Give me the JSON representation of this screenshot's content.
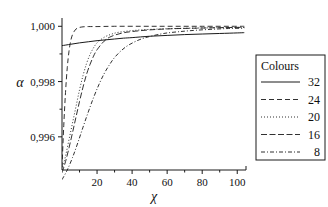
{
  "chart_data": {
    "type": "line",
    "title": "",
    "xlabel": "χ",
    "ylabel": "α",
    "xlim": [
      0,
      105
    ],
    "ylim": [
      0.9948,
      1.0003
    ],
    "grid": false,
    "legend_position": "right-outside",
    "legend_title": "Colours",
    "x_ticks": [
      20,
      40,
      60,
      80,
      100
    ],
    "x_tick_labels": [
      "20",
      "40",
      "60",
      "80",
      "100"
    ],
    "y_ticks": [
      0.996,
      0.998,
      1.0
    ],
    "y_tick_labels": [
      "0,996",
      "0,998",
      "1,000"
    ],
    "series": [
      {
        "name": "32",
        "label": "32",
        "style": "solid",
        "dash": "none",
        "color": "#1a1a1a",
        "x": [
          0,
          5,
          10,
          15,
          20,
          25,
          30,
          35,
          40,
          50,
          60,
          70,
          80,
          90,
          100,
          104
        ],
        "values": [
          0.9993,
          0.99935,
          0.9994,
          0.99944,
          0.99948,
          0.99951,
          0.99954,
          0.99957,
          0.99959,
          0.99964,
          0.99967,
          0.9997,
          0.99972,
          0.99974,
          0.99976,
          0.99977
        ]
      },
      {
        "name": "24",
        "label": "24",
        "style": "dashed",
        "dash": "5,3",
        "color": "#1a1a1a",
        "x": [
          0,
          1,
          2,
          3,
          4,
          5,
          6,
          7,
          8,
          9,
          10,
          12,
          15,
          20,
          30,
          45,
          60,
          80,
          100,
          104
        ],
        "values": [
          0.9949,
          0.9964,
          0.9976,
          0.9985,
          0.9991,
          0.99948,
          0.9997,
          0.99982,
          0.9999,
          0.99994,
          0.99996,
          0.99998,
          0.99999,
          0.99999,
          1.0,
          1.0,
          1.0,
          1.0,
          1.0,
          1.0
        ]
      },
      {
        "name": "20",
        "label": "20",
        "style": "dotted",
        "dash": "1,2",
        "color": "#1a1a1a",
        "x": [
          0,
          2,
          4,
          6,
          8,
          10,
          12,
          14,
          16,
          18,
          20,
          24,
          28,
          32,
          38,
          45,
          55,
          65,
          80,
          100,
          104
        ],
        "values": [
          0.9948,
          0.9953,
          0.9959,
          0.9965,
          0.9971,
          0.9977,
          0.99822,
          0.99865,
          0.99898,
          0.99922,
          0.9994,
          0.9996,
          0.99971,
          0.99978,
          0.99983,
          0.99987,
          0.9999,
          0.99992,
          0.99994,
          0.99996,
          0.99996
        ]
      },
      {
        "name": "16",
        "label": "16",
        "style": "long-dashed",
        "dash": "6,2.5",
        "color": "#1a1a1a",
        "x": [
          0,
          2,
          4,
          6,
          8,
          10,
          12,
          14,
          16,
          18,
          20,
          24,
          28,
          34,
          40,
          50,
          62,
          75,
          90,
          100,
          104
        ],
        "values": [
          0.9947,
          0.9951,
          0.9956,
          0.99615,
          0.99672,
          0.99728,
          0.9978,
          0.99826,
          0.99862,
          0.99892,
          0.99915,
          0.99946,
          0.99963,
          0.99975,
          0.99981,
          0.99987,
          0.99991,
          0.99993,
          0.99995,
          0.99996,
          0.99996
        ]
      },
      {
        "name": "8",
        "label": "8",
        "style": "dash-dot",
        "dash": "4,2,1,2",
        "color": "#1a1a1a",
        "x": [
          0,
          3,
          6,
          9,
          12,
          15,
          18,
          21,
          24,
          27,
          30,
          34,
          38,
          44,
          50,
          58,
          66,
          75,
          85,
          95,
          104
        ],
        "values": [
          0.99445,
          0.9948,
          0.99525,
          0.99578,
          0.99635,
          0.9969,
          0.99742,
          0.99788,
          0.99828,
          0.9986,
          0.99887,
          0.99913,
          0.99932,
          0.99951,
          0.99963,
          0.99974,
          0.9998,
          0.99985,
          0.99989,
          0.99992,
          0.99993
        ]
      }
    ]
  },
  "legend": {
    "title": "Colours",
    "entries": [
      {
        "label": "32",
        "style": "solid"
      },
      {
        "label": "24",
        "style": "dashed"
      },
      {
        "label": "20",
        "style": "dotted"
      },
      {
        "label": "16",
        "style": "long-dashed"
      },
      {
        "label": "8",
        "style": "dash-dot"
      }
    ]
  },
  "axes": {
    "y_axis_title": "α",
    "x_axis_title": "χ"
  }
}
